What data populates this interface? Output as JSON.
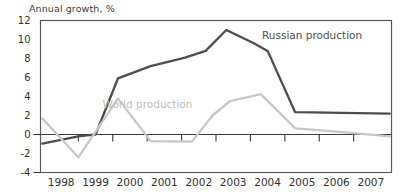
{
  "chart_data": {
    "type": "line",
    "title": "Annual growth, %",
    "xlabel": "",
    "ylabel": "Annual growth, %",
    "ylim": [
      -4,
      12
    ],
    "xlim": [
      1997.4,
      2007.6
    ],
    "grid": false,
    "legend_position": "inline-annotations",
    "yticks": [
      12,
      10,
      8,
      6,
      4,
      2,
      0,
      -2,
      -4
    ],
    "ytick_labels": [
      "12",
      "10",
      "8",
      "6",
      "4",
      "2",
      "0",
      "-2",
      "-4"
    ],
    "categories": [
      "1998",
      "1999",
      "2000",
      "2001",
      "2002",
      "2003",
      "2004",
      "2005",
      "2006",
      "2007"
    ],
    "xtick_labels": [
      "1998",
      "1999",
      "2000",
      "2001",
      "2002",
      "2003",
      "2004",
      "2005",
      "2006",
      "2007"
    ],
    "series": [
      {
        "name": "Russian production",
        "color": "#4d4d4d",
        "points": [
          {
            "x": 1997.45,
            "y": -0.95
          },
          {
            "x": 1998.5,
            "y": -0.2
          },
          {
            "x": 1998.75,
            "y": -0.1
          },
          {
            "x": 1999.0,
            "y": 0.0
          },
          {
            "x": 1999.65,
            "y": 5.9
          },
          {
            "x": 2000.6,
            "y": 7.2
          },
          {
            "x": 2001.6,
            "y": 8.1
          },
          {
            "x": 2002.2,
            "y": 8.8
          },
          {
            "x": 2002.8,
            "y": 11.0
          },
          {
            "x": 2003.6,
            "y": 9.6
          },
          {
            "x": 2004.0,
            "y": 8.8
          },
          {
            "x": 2004.8,
            "y": 2.35
          },
          {
            "x": 2007.55,
            "y": 2.2
          }
        ]
      },
      {
        "name": "World production",
        "color": "#c7c7c7",
        "points": [
          {
            "x": 1997.45,
            "y": 1.7
          },
          {
            "x": 1998.5,
            "y": -2.4
          },
          {
            "x": 1999.65,
            "y": 3.8
          },
          {
            "x": 2000.6,
            "y": -0.7
          },
          {
            "x": 2001.8,
            "y": -0.75
          },
          {
            "x": 2002.4,
            "y": 2.0
          },
          {
            "x": 2002.9,
            "y": 3.5
          },
          {
            "x": 2003.8,
            "y": 4.25
          },
          {
            "x": 2004.8,
            "y": 0.65
          },
          {
            "x": 2006.0,
            "y": 0.3
          },
          {
            "x": 2007.55,
            "y": -0.2
          }
        ]
      }
    ],
    "annotations": [
      {
        "text": "Russian production",
        "x": 2005.0,
        "y": 10.4
      },
      {
        "text": "World production",
        "x": 2000.6,
        "y": 3.1
      }
    ]
  }
}
